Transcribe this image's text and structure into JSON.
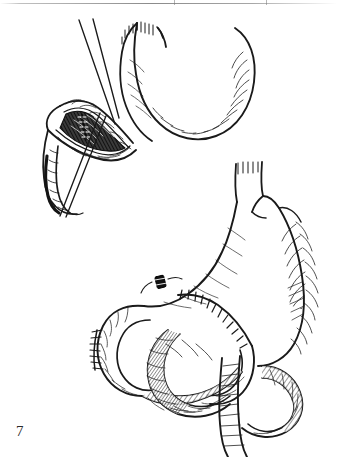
{
  "page": {
    "background_color": "#ffffff",
    "ink_color": "#1a1a1a",
    "width": 337,
    "height": 457,
    "media": "scanned surgical atlas page, pen-and-ink line drawing"
  },
  "scan_artifacts": {
    "top_rule_present": true,
    "top_rule_color": "#8c8c8c",
    "tick_marks": [
      174,
      266
    ]
  },
  "figure": {
    "number": "7",
    "number_color": "#2b2b2b"
  },
  "panels": [
    {
      "id": "upper-panel",
      "name": "opened-duodenal-stump",
      "description": "Stomach with distal duodenum opened longitudinally, exposing posterior wall ulcer crater; two long traction sutures pass through the duodenotomy.",
      "structures": [
        {
          "name": "stomach-body",
          "label": "stomach"
        },
        {
          "name": "duodenal-stump",
          "label": "duodenal stump"
        },
        {
          "name": "ulcer-crater",
          "label": "posterior ulcer crater"
        },
        {
          "name": "traction-suture",
          "label": "traction suture"
        },
        {
          "name": "mucosal-folds",
          "label": "mucosal folds"
        }
      ]
    },
    {
      "id": "lower-panel",
      "name": "gastrojejunostomy-reconstruction",
      "description": "Completed gastrojejunal anastomosis with interwoven afferent and efferent jejunal loops; closed jejunal stump at left and a ligature clip on the proximal loop.",
      "structures": [
        {
          "name": "stomach-body",
          "label": "stomach"
        },
        {
          "name": "esophagus",
          "label": "esophagus"
        },
        {
          "name": "anastomosis-suture-line",
          "label": "gastrojejunal anastomosis"
        },
        {
          "name": "closed-stump-suture-line",
          "label": "closed jejunal stump"
        },
        {
          "name": "ligature-clip",
          "label": "ligature clip"
        },
        {
          "name": "afferent-loop",
          "label": "afferent jejunal loop"
        },
        {
          "name": "efferent-loop",
          "label": "efferent jejunal loop"
        }
      ]
    }
  ]
}
